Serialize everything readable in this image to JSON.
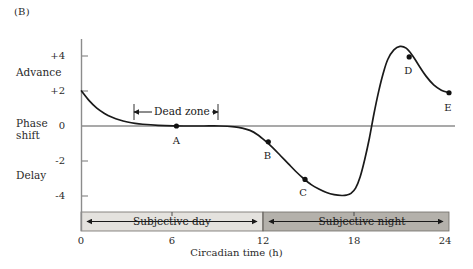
{
  "figure": {
    "panel_label": "(B)",
    "y_axis_titles": {
      "advance": "Advance",
      "phase_shift_line1": "Phase",
      "phase_shift_line2": "shift",
      "delay": "Delay"
    },
    "x_axis_title": "Circadian time (h)",
    "annotations": {
      "dead_zone": "Dead zone",
      "subjective_day": "Subjective day",
      "subjective_night": "Subjective night"
    },
    "colors": {
      "curve": "#1a1a1a",
      "axis": "#8c8c8c",
      "zero_line": "#8c8c8c",
      "subjective_day_band": "#e4e2de",
      "subjective_night_band": "#b4b1ab",
      "band_border": "#6e6b66",
      "text": "#1a1a1a"
    }
  },
  "chart_data": {
    "type": "line",
    "title": "(B)",
    "xlabel": "Circadian time (h)",
    "ylabel": "Phase shift",
    "xlim": [
      0,
      24
    ],
    "ylim": [
      -5,
      5.2
    ],
    "xticks": [
      0,
      6,
      12,
      18,
      24
    ],
    "xtick_labels": [
      "0",
      "6",
      "12",
      "18",
      "24"
    ],
    "yticks": [
      -4,
      -2,
      0,
      2,
      4
    ],
    "ytick_labels": [
      "-4",
      "-2",
      "0",
      "+2",
      "+4"
    ],
    "grid": false,
    "legend": null,
    "series": [
      {
        "name": "Phase response curve",
        "x": [
          0,
          0.5,
          1,
          1.5,
          2,
          2.5,
          3,
          3.5,
          4,
          5,
          6,
          7,
          8,
          9,
          10,
          10.5,
          11,
          11.5,
          12,
          12.5,
          13,
          13.5,
          14,
          14.5,
          15,
          15.5,
          16,
          16.5,
          17,
          17.3,
          17.6,
          17.9,
          18.2,
          18.5,
          18.8,
          19.1,
          19.4,
          19.7,
          20,
          20.4,
          20.8,
          21.2,
          21.6,
          22,
          22.5,
          23,
          23.5,
          24
        ],
        "y": [
          2.0,
          1.45,
          1.02,
          0.72,
          0.5,
          0.34,
          0.23,
          0.15,
          0.1,
          0.04,
          0.01,
          0.0,
          0.0,
          0.0,
          -0.05,
          -0.12,
          -0.25,
          -0.5,
          -0.85,
          -1.25,
          -1.7,
          -2.15,
          -2.6,
          -3.0,
          -3.35,
          -3.6,
          -3.8,
          -3.92,
          -3.97,
          -3.95,
          -3.85,
          -3.55,
          -2.9,
          -1.9,
          -0.7,
          0.7,
          1.95,
          3.0,
          3.8,
          4.35,
          4.55,
          4.45,
          4.05,
          3.5,
          2.85,
          2.35,
          2.05,
          1.9
        ]
      }
    ],
    "labeled_points": [
      {
        "label": "A",
        "x": 6.2,
        "y": 0.0
      },
      {
        "label": "B",
        "x": 12.2,
        "y": -0.9
      },
      {
        "label": "C",
        "x": 14.6,
        "y": -3.05
      },
      {
        "label": "D",
        "x": 21.4,
        "y": 3.95
      },
      {
        "label": "E",
        "x": 24.0,
        "y": 1.9
      }
    ],
    "annotations": [
      {
        "type": "double-arrow",
        "label": "Dead zone",
        "x_start": 3.5,
        "x_end": 9.0,
        "y": 0.78
      },
      {
        "type": "band",
        "label": "Subjective day",
        "x_start": 0,
        "x_end": 12,
        "fill": "#e4e2de"
      },
      {
        "type": "band",
        "label": "Subjective night",
        "x_start": 12,
        "x_end": 24,
        "fill": "#b4b1ab"
      }
    ]
  }
}
